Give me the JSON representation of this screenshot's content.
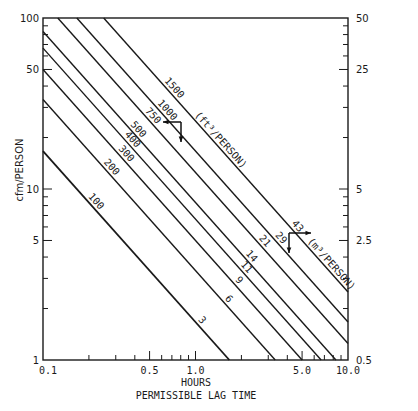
{
  "chart_data": {
    "type": "line",
    "title": "",
    "xlabel": "HOURS",
    "xlabel_sub": "PERMISSIBLE LAG TIME",
    "ylabel": "cfm/PERSON",
    "y2label_units": "m3/PERSON (implied)",
    "xscale": "log",
    "yscale": "log",
    "xlim": [
      0.1,
      10.0
    ],
    "ylim": [
      1,
      100
    ],
    "y2lim": [
      0.5,
      50
    ],
    "x_ticks": [
      "0.1",
      "0.5",
      "1.0",
      "5.0",
      "10.0"
    ],
    "x_tick_values": [
      0.1,
      0.5,
      1.0,
      5.0,
      10.0
    ],
    "y_ticks": [
      "1",
      "5",
      "10",
      "50",
      "100"
    ],
    "y_tick_values": [
      1,
      5,
      10,
      50,
      100
    ],
    "y2_ticks": [
      "0.5",
      "2.5",
      "5",
      "25",
      "50"
    ],
    "y2_tick_values": [
      0.5,
      2.5,
      5,
      25,
      50
    ],
    "grid": false,
    "legend": "inline labels on lines",
    "series_units_upper": "(ft3/PERSON)",
    "series_units_lower": "(m3/PERSON)",
    "series": [
      {
        "name": "100 ft3 / 3 m3",
        "ft3": 100,
        "m3": 3,
        "label_ft3": "100",
        "label_m3": "3"
      },
      {
        "name": "200 ft3 / 6 m3",
        "ft3": 200,
        "m3": 6,
        "label_ft3": "200",
        "label_m3": "6"
      },
      {
        "name": "300 ft3 / 9 m3",
        "ft3": 300,
        "m3": 9,
        "label_ft3": "300",
        "label_m3": "9"
      },
      {
        "name": "400 ft3 / 11 m3",
        "ft3": 400,
        "m3": 11,
        "label_ft3": "400",
        "label_m3": "11"
      },
      {
        "name": "500 ft3 / 14 m3",
        "ft3": 500,
        "m3": 14,
        "label_ft3": "500",
        "label_m3": "14"
      },
      {
        "name": "750 ft3 / 21 m3",
        "ft3": 750,
        "m3": 21,
        "label_ft3": "750",
        "label_m3": "21"
      },
      {
        "name": "1000 ft3 / 29 m3",
        "ft3": 1000,
        "m3": 29,
        "label_ft3": "1000",
        "label_m3": "29"
      },
      {
        "name": "1500 ft3 / 43 m3",
        "ft3": 1500,
        "m3": 43,
        "label_ft3": "1500",
        "label_m3": "43"
      }
    ],
    "relation": "cfm_per_person = ft3_per_person / (60 * hours)",
    "annotations": [
      {
        "text": "arrows: read upper labels with left axis (cfm) — arrow pointing left/down near 750 line"
      },
      {
        "text": "arrows: read lower labels with right axis (m3) — arrow pointing right/down near 29–43 lines"
      }
    ]
  },
  "labels": {
    "upper_units": "(ft",
    "upper_sup": "3",
    "upper_units_tail": "/PERSON)",
    "lower_units": "(m",
    "lower_sup": "3",
    "lower_units_tail": "/PERSON)"
  }
}
